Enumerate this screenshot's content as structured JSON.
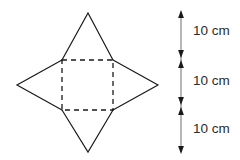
{
  "diagram": {
    "stroke_color": "#1a1a1a",
    "fill_color": "none",
    "background_color": "#ffffff",
    "text_color": "#2b2b2b",
    "net": {
      "name": "square-pyramid-net",
      "base": {
        "shape": "square",
        "line_style": "dashed",
        "corners": [
          {
            "x": 62,
            "y": 60
          },
          {
            "x": 113,
            "y": 60
          },
          {
            "x": 113,
            "y": 110
          },
          {
            "x": 62,
            "y": 110
          }
        ],
        "dash_pattern": "5,4"
      },
      "faces": [
        {
          "name": "triangle-top",
          "line_style": "solid",
          "points": "62,60 88,13 113,60"
        },
        {
          "name": "triangle-bottom",
          "line_style": "solid",
          "points": "62,110 88,152 113,110"
        },
        {
          "name": "triangle-left",
          "line_style": "solid",
          "points": "62,60 17,85 62,110"
        },
        {
          "name": "triangle-right",
          "line_style": "solid",
          "points": "113,60 158,85 113,110"
        }
      ]
    },
    "scale": {
      "name": "vertical-measurement-scale",
      "axis_x": 181,
      "top_y": 12,
      "bottom_y": 152,
      "divisions_y": [
        58,
        105
      ],
      "arrow_style": "double-headed",
      "segments": [
        {
          "label": "10 cm",
          "label_x": 193,
          "label_y": 31
        },
        {
          "label": "10 cm",
          "label_x": 193,
          "label_y": 81
        },
        {
          "label": "10 cm",
          "label_x": 193,
          "label_y": 129
        }
      ]
    }
  }
}
